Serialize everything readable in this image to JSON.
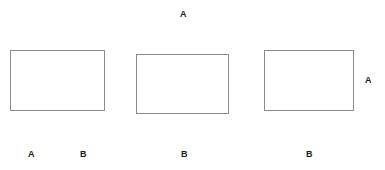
{
  "canvas": {
    "width": 385,
    "height": 170,
    "background_color": "#ffffff"
  },
  "style": {
    "rect_border_color": "#8a8a8a",
    "rect_fill_color": "#ffffff",
    "label_color": "#1a1a1a",
    "label_font_size_px": 9,
    "label_font_weight": "bold"
  },
  "shapes": [
    {
      "id": "rectangle-1",
      "name": "rectangle-left",
      "x": 10,
      "y": 50,
      "width": 95,
      "height": 61
    },
    {
      "id": "rectangle-2",
      "name": "rectangle-middle",
      "x": 136,
      "y": 54,
      "width": 93,
      "height": 60
    },
    {
      "id": "rectangle-3",
      "name": "rectangle-right",
      "x": 264,
      "y": 50,
      "width": 90,
      "height": 61
    }
  ],
  "labels": [
    {
      "id": "label-top-a",
      "name": "label-top-center-a",
      "text": "A",
      "x": 180,
      "y": 10
    },
    {
      "id": "label-right-a",
      "name": "label-right-a",
      "text": "A",
      "x": 365,
      "y": 76
    },
    {
      "id": "label-bottom-a",
      "name": "label-bottom-left-a",
      "text": "A",
      "x": 28,
      "y": 150
    },
    {
      "id": "label-bottom-b1",
      "name": "label-bottom-left-b",
      "text": "B",
      "x": 80,
      "y": 150
    },
    {
      "id": "label-bottom-b2",
      "name": "label-bottom-middle-b",
      "text": "B",
      "x": 181,
      "y": 150
    },
    {
      "id": "label-bottom-b3",
      "name": "label-bottom-right-b",
      "text": "B",
      "x": 306,
      "y": 150
    }
  ]
}
